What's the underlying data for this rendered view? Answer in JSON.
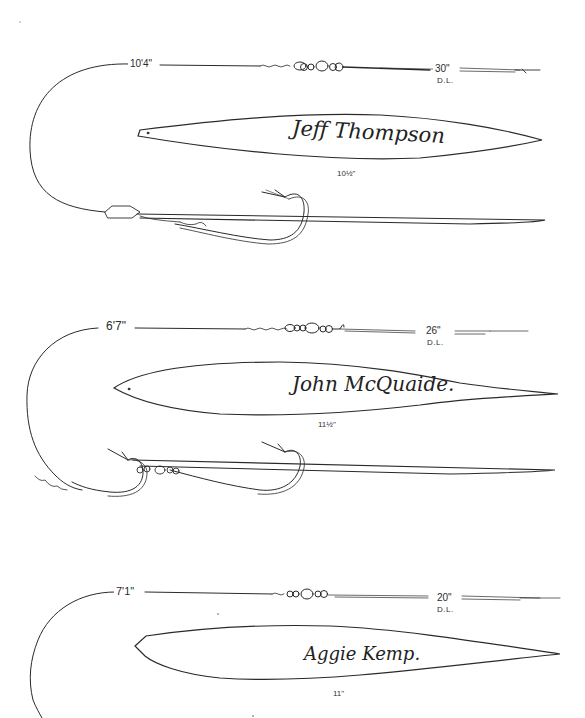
{
  "rigs": [
    {
      "leader_length": "10'4\"",
      "line_test": "30\"",
      "line_type": "D.L.",
      "maker_signature": "Jeff Thompson",
      "lure_length": "10½\""
    },
    {
      "leader_length": "6'7\"",
      "line_test": "26\"",
      "line_type": "D.L.",
      "maker_signature": "John McQuaide.",
      "lure_length": "11½\""
    },
    {
      "leader_length": "7'1\"",
      "line_test": "20\"",
      "line_type": "D.L.",
      "maker_signature": "Aggie Kemp.",
      "lure_length": "11\""
    }
  ],
  "colors": {
    "ink": "#2a2a2a",
    "paper": "#ffffff"
  }
}
